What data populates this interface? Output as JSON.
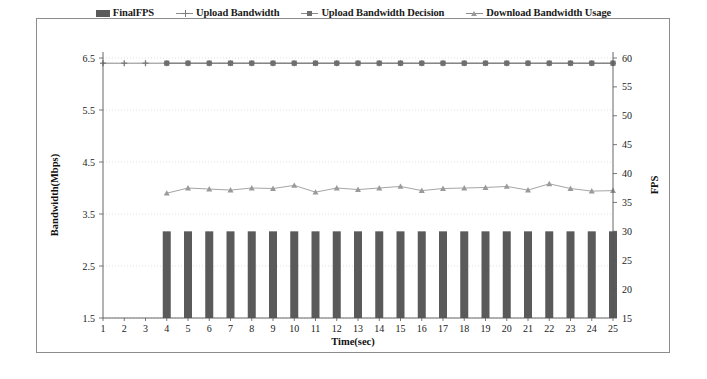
{
  "legend": {
    "items": [
      {
        "label": "FinalFPS",
        "marker": "bar-swatch-icon",
        "color": "#5a5a5a"
      },
      {
        "label": "Upload Bandwidth",
        "marker": "plus-marker-icon",
        "color": "#7a7a7a"
      },
      {
        "label": "Upload Bandwidth Decision",
        "marker": "square-marker-icon",
        "color": "#6e6e6e"
      },
      {
        "label": "Download Bandwidth Usage",
        "marker": "triangle-marker-icon",
        "color": "#9a9a9a"
      }
    ]
  },
  "axes": {
    "x_title": "Time(sec)",
    "y_left_title": "Bandwidth(Mbps)",
    "y_right_title": "FPS",
    "x_ticks": [
      "1",
      "2",
      "3",
      "4",
      "5",
      "6",
      "7",
      "8",
      "9",
      "10",
      "11",
      "12",
      "13",
      "14",
      "15",
      "16",
      "17",
      "18",
      "19",
      "20",
      "21",
      "22",
      "23",
      "24",
      "25"
    ],
    "y_left_ticks": [
      "1.5",
      "2.5",
      "3.5",
      "4.5",
      "5.5",
      "6.5"
    ],
    "y_right_ticks": [
      "15",
      "20",
      "25",
      "30",
      "35",
      "40",
      "45",
      "50",
      "55",
      "60"
    ]
  },
  "chart_data": {
    "type": "line",
    "title": "",
    "xlabel": "Time(sec)",
    "ylabel": "Bandwidth(Mbps)",
    "y2label": "FPS",
    "x": [
      1,
      2,
      3,
      4,
      5,
      6,
      7,
      8,
      9,
      10,
      11,
      12,
      13,
      14,
      15,
      16,
      17,
      18,
      19,
      20,
      21,
      22,
      23,
      24,
      25
    ],
    "ylim": [
      1.5,
      6.5
    ],
    "y2lim": [
      15,
      60
    ],
    "grid": true,
    "legend_position": "top",
    "series": [
      {
        "name": "FinalFPS",
        "type": "bar",
        "axis": "right",
        "unit": "FPS",
        "color": "#5a5a5a",
        "x": [
          4,
          5,
          6,
          7,
          8,
          9,
          10,
          11,
          12,
          13,
          14,
          15,
          16,
          17,
          18,
          19,
          20,
          21,
          22,
          23,
          24,
          25
        ],
        "values": [
          30,
          30,
          30,
          30,
          30,
          30,
          30,
          30,
          30,
          30,
          30,
          30,
          30,
          30,
          30,
          30,
          30,
          30,
          30,
          30,
          30,
          30
        ]
      },
      {
        "name": "Upload Bandwidth",
        "type": "line",
        "axis": "left",
        "unit": "Mbps",
        "marker": "plus",
        "color": "#7a7a7a",
        "x": [
          1,
          2,
          3,
          4,
          5,
          6,
          7,
          8,
          9,
          10,
          11,
          12,
          13,
          14,
          15,
          16,
          17,
          18,
          19,
          20,
          21,
          22,
          23,
          24,
          25
        ],
        "values": [
          6.4,
          6.4,
          6.4,
          6.4,
          6.4,
          6.4,
          6.4,
          6.4,
          6.4,
          6.4,
          6.4,
          6.4,
          6.4,
          6.4,
          6.4,
          6.4,
          6.4,
          6.4,
          6.4,
          6.4,
          6.4,
          6.4,
          6.4,
          6.4,
          6.4
        ]
      },
      {
        "name": "Upload Bandwidth Decision",
        "type": "line",
        "axis": "left",
        "unit": "Mbps",
        "marker": "square",
        "color": "#6e6e6e",
        "x": [
          4,
          5,
          6,
          7,
          8,
          9,
          10,
          11,
          12,
          13,
          14,
          15,
          16,
          17,
          18,
          19,
          20,
          21,
          22,
          23,
          24,
          25
        ],
        "values": [
          6.4,
          6.4,
          6.4,
          6.4,
          6.4,
          6.4,
          6.4,
          6.4,
          6.4,
          6.4,
          6.4,
          6.4,
          6.4,
          6.4,
          6.4,
          6.4,
          6.4,
          6.4,
          6.4,
          6.4,
          6.4,
          6.4
        ]
      },
      {
        "name": "Download Bandwidth Usage",
        "type": "line",
        "axis": "left",
        "unit": "Mbps",
        "marker": "triangle",
        "color": "#9a9a9a",
        "x": [
          4,
          5,
          6,
          7,
          8,
          9,
          10,
          11,
          12,
          13,
          14,
          15,
          16,
          17,
          18,
          19,
          20,
          21,
          22,
          23,
          24,
          25
        ],
        "values": [
          3.9,
          4.0,
          3.98,
          3.96,
          4.0,
          3.99,
          4.05,
          3.92,
          4.0,
          3.97,
          4.0,
          4.03,
          3.95,
          3.99,
          4.0,
          4.01,
          4.03,
          3.96,
          4.08,
          3.99,
          3.94,
          3.95
        ]
      }
    ]
  }
}
